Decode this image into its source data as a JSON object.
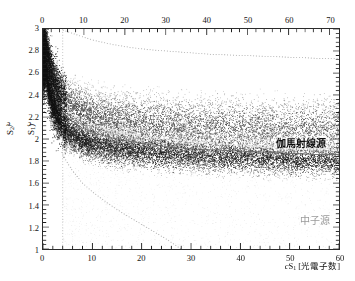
{
  "chart_data": {
    "type": "scatter",
    "title": "",
    "subtitle": "",
    "xlabel": "cS1 [光電子数]",
    "xlabel_parts": {
      "symbol": "cS",
      "sub": "1",
      "unit": "[光電子数]"
    },
    "ylabel": "log10(cS2/cS1)",
    "ylabel_parts": {
      "prefix": "log",
      "prefix_sub": "10",
      "body": "(cS2/cS1)"
    },
    "xlim": [
      0,
      60
    ],
    "ylim": [
      1,
      3
    ],
    "xlim_top": [
      0,
      72.3
    ],
    "xticks_bottom": [
      0,
      10,
      20,
      30,
      40,
      50,
      60
    ],
    "xticks_bottom_labels": [
      "0",
      "10",
      "20",
      "30",
      "40",
      "50",
      "60"
    ],
    "xticks_top": [
      0,
      10,
      20,
      30,
      40,
      50,
      60,
      70
    ],
    "xticks_top_labels": [
      "0",
      "10",
      "20",
      "30",
      "40",
      "50",
      "60",
      "70"
    ],
    "yticks": [
      1,
      1.2,
      1.4,
      1.6,
      1.8,
      2,
      2.2,
      2.4,
      2.6,
      2.8,
      3
    ],
    "yticks_labels": [
      "1",
      "1.2",
      "1.4",
      "1.6",
      "1.8",
      "2",
      "2.2",
      "2.4",
      "2.6",
      "2.8",
      "3"
    ],
    "x_minor_per_major": 5,
    "y_minor_per_major": 5,
    "grid": false,
    "legend_position": "none",
    "axes_note": "dual x-axis: bottom 0-60 labelled, top 0-70 labelled",
    "series": [
      {
        "name": "伽馬射線源",
        "role": "electronic-recoil band (gamma source)",
        "marker": "dot",
        "color": "#4a4a4a",
        "point_size": 0.9,
        "n_points": 9000,
        "band_center_x": [
          0.5,
          1,
          2,
          3,
          4,
          5,
          6,
          8,
          10,
          13,
          16,
          20,
          25,
          30,
          35,
          40,
          45,
          50,
          55,
          60
        ],
        "band_center_y": [
          2.86,
          2.74,
          2.56,
          2.45,
          2.38,
          2.33,
          2.3,
          2.25,
          2.22,
          2.19,
          2.17,
          2.15,
          2.13,
          2.12,
          2.11,
          2.1,
          2.1,
          2.09,
          2.09,
          2.09
        ],
        "band_halfwidth": [
          0.1,
          0.13,
          0.17,
          0.19,
          0.21,
          0.22,
          0.23,
          0.24,
          0.245,
          0.25,
          0.25,
          0.255,
          0.26,
          0.26,
          0.26,
          0.265,
          0.265,
          0.27,
          0.27,
          0.27
        ],
        "label_x": 46,
        "label_y": 2.22
      },
      {
        "name": "中子源",
        "role": "nuclear-recoil band (neutron source)",
        "marker": "dot",
        "color": "#1a1a1a",
        "point_size": 0.9,
        "n_points": 11000,
        "band_center_x": [
          0.5,
          1,
          2,
          3,
          4,
          5,
          6,
          8,
          10,
          13,
          16,
          20,
          25,
          30,
          35,
          40,
          45,
          50,
          55,
          60
        ],
        "band_center_y": [
          2.62,
          2.48,
          2.3,
          2.19,
          2.12,
          2.07,
          2.03,
          1.99,
          1.96,
          1.93,
          1.91,
          1.89,
          1.87,
          1.86,
          1.85,
          1.84,
          1.83,
          1.82,
          1.81,
          1.8
        ],
        "band_halfwidth": [
          0.1,
          0.12,
          0.14,
          0.15,
          0.155,
          0.16,
          0.16,
          0.16,
          0.16,
          0.16,
          0.16,
          0.16,
          0.16,
          0.155,
          0.155,
          0.15,
          0.15,
          0.15,
          0.145,
          0.145
        ],
        "label_x": 52,
        "label_y": 1.52
      },
      {
        "name": "diffuse-background",
        "role": "sparse low-density tail below nuclear-recoil band",
        "marker": "dot",
        "color": "#c9c9c9",
        "point_size": 0.8,
        "n_points": 1400
      }
    ],
    "reference_lines": [
      {
        "name": "upper-boundary-curve",
        "style": "dotted",
        "color": "#c0c0c0",
        "x": [
          4,
          6,
          8,
          10,
          14,
          18,
          22,
          28,
          34,
          40,
          46,
          52,
          58,
          60
        ],
        "y": [
          2.99,
          2.96,
          2.93,
          2.9,
          2.86,
          2.83,
          2.81,
          2.79,
          2.77,
          2.76,
          2.75,
          2.74,
          2.73,
          2.73
        ]
      },
      {
        "name": "er-band-mean-curve",
        "style": "dotted-thick",
        "color": "#e8e8e8",
        "x": [
          4,
          5,
          6,
          8,
          10,
          13,
          16,
          20,
          25,
          30,
          35,
          40,
          45,
          50,
          55,
          60
        ],
        "y": [
          2.31,
          2.26,
          2.22,
          2.17,
          2.13,
          2.09,
          2.06,
          2.03,
          2.0,
          1.98,
          1.96,
          1.94,
          1.93,
          1.92,
          1.91,
          1.9
        ]
      },
      {
        "name": "nr-band-mean-curve",
        "style": "solid-thin",
        "color": "#707070",
        "x": [
          4,
          5,
          6,
          8,
          10,
          13,
          16,
          20,
          25,
          30,
          35,
          40,
          45,
          50,
          55,
          60
        ],
        "y": [
          2.25,
          2.2,
          2.16,
          2.1,
          2.06,
          2.02,
          1.99,
          1.96,
          1.93,
          1.91,
          1.9,
          1.89,
          1.88,
          1.87,
          1.86,
          1.86
        ]
      },
      {
        "name": "lower-boundary-curve",
        "style": "dotted",
        "color": "#bdbdbd",
        "x": [
          4,
          5,
          6,
          8,
          10,
          13,
          16,
          19,
          22,
          25,
          28
        ],
        "y": [
          1.86,
          1.78,
          1.71,
          1.6,
          1.52,
          1.42,
          1.33,
          1.25,
          1.17,
          1.09,
          1.0
        ]
      },
      {
        "name": "threshold-vertical-line",
        "style": "dotted",
        "color": "#c8c8c8",
        "x": [
          4,
          4
        ],
        "y": [
          1.0,
          3.0
        ]
      }
    ],
    "annotations": [
      {
        "name": "gamma-source-label",
        "text": "伽馬射線源",
        "x": 46,
        "y": 2.22,
        "color": "#0d0d0d"
      },
      {
        "name": "neutron-source-label",
        "text": "中子源",
        "x": 52,
        "y": 1.52,
        "color": "#9a9a9a"
      },
      {
        "name": "faint-threshold-label",
        "text": "閾値",
        "x": 8,
        "y": 1.12,
        "color": "#dcdcdc"
      }
    ]
  },
  "figure": {
    "background_color": "#ffffff",
    "frame_color": "#2b2b2b",
    "tick_color": "#151515"
  }
}
